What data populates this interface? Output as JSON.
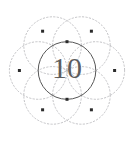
{
  "figure": {
    "name": "seed-of-life-geometric-figure",
    "label": "10",
    "label_font_size": 30,
    "canvas": {
      "width": 135,
      "height": 143,
      "background": "#ffffff"
    },
    "center": {
      "x": 67,
      "y": 70.5
    },
    "radius": 28.8,
    "colors": {
      "main_stroke": "#575757",
      "petal_stroke": "#b9b9bd",
      "petal_stroke_faint": "#cfcfd4",
      "dot_fill": "#2b2b2b",
      "label_fill": "#5d5d5d"
    },
    "strokes": {
      "main_width": 1.0,
      "petal_width": 0.85,
      "petal_dash": "1.4 2.1"
    },
    "dot_size": 3.0,
    "main_circle": {
      "cx": 67,
      "cy": 70.5,
      "r": 28.8,
      "style": "solid"
    },
    "petal_circles": [
      {
        "name": "petal-right",
        "cx": 95.8,
        "cy": 70.5,
        "r": 28.8,
        "style": "dotted"
      },
      {
        "name": "petal-upper-right",
        "cx": 81.4,
        "cy": 45.6,
        "r": 28.8,
        "style": "dotted"
      },
      {
        "name": "petal-upper-left",
        "cx": 52.6,
        "cy": 45.6,
        "r": 28.8,
        "style": "dotted"
      },
      {
        "name": "petal-left",
        "cx": 38.2,
        "cy": 70.5,
        "r": 28.8,
        "style": "dotted"
      },
      {
        "name": "petal-lower-left",
        "cx": 52.6,
        "cy": 95.4,
        "r": 28.8,
        "style": "dotted"
      },
      {
        "name": "petal-lower-right",
        "cx": 81.4,
        "cy": 95.4,
        "r": 28.8,
        "style": "dotted"
      }
    ],
    "vertex_dots": [
      {
        "name": "dot-top-center",
        "x": 67,
        "y": 41.7
      },
      {
        "name": "dot-bottom-center",
        "x": 67,
        "y": 99.3
      },
      {
        "name": "dot-left",
        "x": 19.4,
        "y": 70.5
      },
      {
        "name": "dot-right",
        "x": 114.6,
        "y": 70.5
      },
      {
        "name": "dot-top-left",
        "x": 42.6,
        "y": 31.2
      },
      {
        "name": "dot-top-right",
        "x": 91.4,
        "y": 31.2
      },
      {
        "name": "dot-bottom-left",
        "x": 42.6,
        "y": 109.8
      },
      {
        "name": "dot-bottom-right",
        "x": 91.4,
        "y": 109.8
      }
    ]
  }
}
